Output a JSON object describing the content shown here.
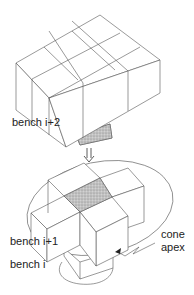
{
  "figure": {
    "type": "diagram",
    "labels": {
      "bench_top": "bench i+2",
      "bench_middle": "bench i+1",
      "bench_bottom": "bench i",
      "cone_line1": "cone",
      "cone_line2": "apex"
    },
    "arrow": {
      "direction": "down",
      "style": "double-line"
    },
    "colors": {
      "stroke": "#555555",
      "shaded_block": "#b8b8b8",
      "background": "#ffffff"
    }
  }
}
